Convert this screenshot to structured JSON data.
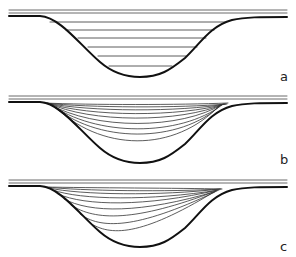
{
  "figure": {
    "panels": [
      {
        "id": "a",
        "label": "a",
        "description": "channel cross-section with horizontal fill layers",
        "layer_style": "horizontal",
        "layer_count": 6
      },
      {
        "id": "b",
        "label": "b",
        "description": "channel cross-section with symmetric concave-up layers",
        "layer_style": "symmetric-curved",
        "layer_count": 9
      },
      {
        "id": "c",
        "label": "c",
        "description": "channel cross-section with asymmetric layers converging toward right bank",
        "layer_style": "asymmetric-curved",
        "layer_count": 9
      }
    ],
    "colors": {
      "line": "#111111",
      "thin_line": "#333333",
      "background": "#ffffff"
    }
  }
}
